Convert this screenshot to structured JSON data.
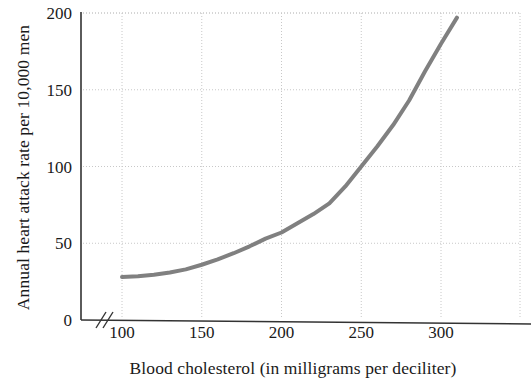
{
  "chart_data": {
    "type": "line",
    "title": "",
    "xlabel": "Blood cholesterol (in milligrams per deciliter)",
    "ylabel": "Annual heart attack rate per 10,000 men",
    "xlim": [
      90,
      325
    ],
    "ylim": [
      0,
      200
    ],
    "xticks": [
      100,
      150,
      200,
      250,
      300
    ],
    "yticks": [
      0,
      50,
      100,
      150,
      200
    ],
    "xtick_labels": [
      "100",
      "150",
      "200",
      "250",
      "300"
    ],
    "ytick_labels": [
      "0",
      "50",
      "100",
      "150",
      "200"
    ],
    "grid": true,
    "legend": "none",
    "axis_break": "//",
    "series": [
      {
        "name": "Annual heart attack rate",
        "color": "#808080",
        "x": [
          100,
          110,
          120,
          130,
          140,
          150,
          160,
          170,
          180,
          190,
          200,
          210,
          220,
          230,
          240,
          250,
          260,
          270,
          280,
          290,
          300,
          310
        ],
        "y": [
          28,
          28.5,
          29.5,
          31,
          33,
          36,
          39.5,
          43.5,
          48,
          53,
          57,
          63,
          69,
          76,
          87,
          100,
          113,
          127,
          143,
          162,
          180,
          197
        ]
      }
    ]
  },
  "axes": {
    "y_title": "Annual heart attack rate per 10,000 men",
    "x_title": "Blood cholesterol (in milligrams per deciliter)"
  },
  "colors": {
    "curve": "#808080",
    "grid": "#c8c8c8",
    "axis": "#333333",
    "text": "#1a1a1a"
  }
}
